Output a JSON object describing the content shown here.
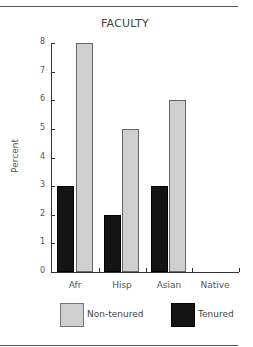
{
  "chart_data": {
    "type": "bar",
    "title": "FACULTY",
    "xlabel": "",
    "ylabel": "Percent",
    "ylim": [
      0,
      8
    ],
    "yticks": [
      0,
      1,
      2,
      3,
      4,
      5,
      6,
      7,
      8
    ],
    "categories": [
      "Afr",
      "Hisp",
      "Asian",
      "Native"
    ],
    "series": [
      {
        "name": "Tenured",
        "color": "#141414",
        "values": [
          3,
          2,
          3,
          0
        ]
      },
      {
        "name": "Non-tenured",
        "color": "#cfcfcf",
        "values": [
          8,
          5,
          6,
          0
        ]
      }
    ],
    "legend": {
      "position": "bottom",
      "entries": [
        "Non-tenured",
        "Tenured"
      ]
    },
    "grid": false
  }
}
